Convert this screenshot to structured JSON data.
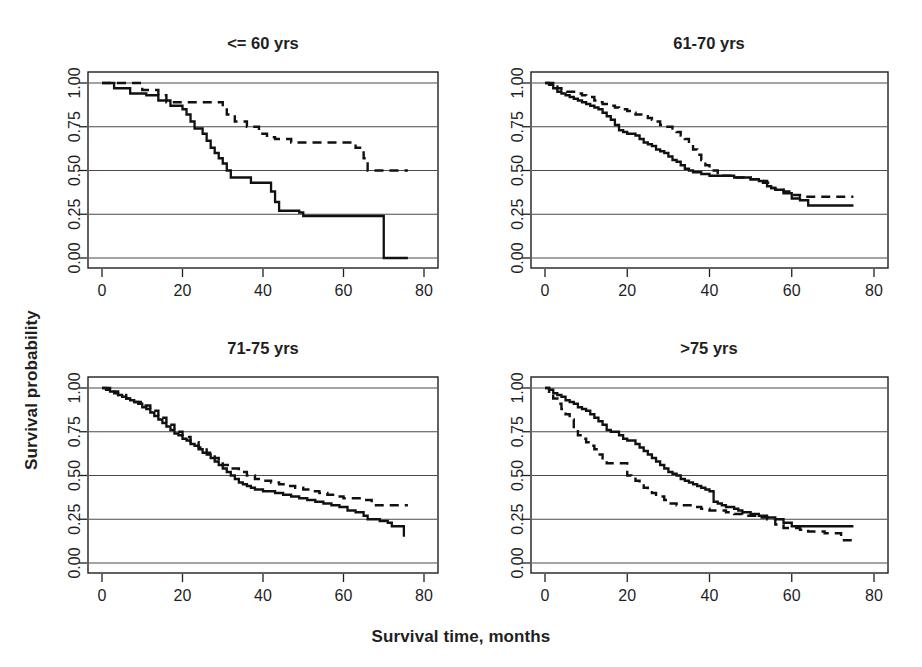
{
  "figure": {
    "x_axis_label": "Survival time, months",
    "y_axis_label": "Survival probability"
  },
  "chart_data": {
    "type": "line",
    "title": "",
    "xlabel": "Survival time, months",
    "ylabel": "Survival probability",
    "xlim": [
      0,
      80
    ],
    "ylim": [
      0,
      1.0
    ],
    "xticks": [
      0,
      20,
      40,
      60,
      80
    ],
    "xtick_labels": [
      "0",
      "20",
      "40",
      "60",
      "80"
    ],
    "yticks": [
      0.0,
      0.25,
      0.5,
      0.75,
      1.0
    ],
    "ytick_labels": [
      "0.00",
      "0.25",
      "0.50",
      "0.75",
      "1.00"
    ],
    "grid": "horizontal",
    "legend_position": "none",
    "series_styles": [
      {
        "name": "solid-group",
        "dash": "solid",
        "color": "#111111"
      },
      {
        "name": "dashed-group",
        "dash": "dashed",
        "color": "#111111"
      }
    ],
    "panels": [
      {
        "id": "panel-le-60",
        "title": "<= 60 yrs",
        "series": [
          {
            "name": "solid-group",
            "dash": "solid",
            "x": [
              0,
              2,
              3,
              5,
              7,
              9,
              11,
              13,
              14,
              16,
              17,
              19,
              20,
              21,
              22,
              23,
              25,
              26,
              27,
              28,
              29,
              30,
              31,
              32,
              34,
              37,
              40,
              42,
              43,
              44,
              49,
              50,
              58,
              70,
              70,
              76
            ],
            "y": [
              1.0,
              1.0,
              0.97,
              0.97,
              0.94,
              0.94,
              0.93,
              0.93,
              0.9,
              0.9,
              0.87,
              0.87,
              0.85,
              0.82,
              0.78,
              0.74,
              0.71,
              0.67,
              0.63,
              0.6,
              0.57,
              0.54,
              0.5,
              0.46,
              0.46,
              0.43,
              0.43,
              0.38,
              0.32,
              0.27,
              0.26,
              0.24,
              0.24,
              0.19,
              0.0,
              0.0
            ]
          },
          {
            "name": "dashed-group",
            "dash": "dashed",
            "x": [
              0,
              4,
              6,
              8,
              10,
              12,
              14,
              16,
              18,
              22,
              25,
              28,
              30,
              31,
              33,
              36,
              37,
              39,
              41,
              43,
              45,
              47,
              50,
              56,
              60,
              63,
              65,
              66,
              70,
              76
            ],
            "y": [
              1.0,
              1.0,
              1.0,
              1.0,
              0.96,
              0.96,
              0.93,
              0.89,
              0.89,
              0.89,
              0.89,
              0.89,
              0.86,
              0.82,
              0.78,
              0.75,
              0.75,
              0.71,
              0.69,
              0.68,
              0.68,
              0.66,
              0.66,
              0.66,
              0.66,
              0.63,
              0.57,
              0.5,
              0.5,
              0.5
            ]
          }
        ]
      },
      {
        "id": "panel-61-70",
        "title": "61-70 yrs",
        "series": [
          {
            "name": "solid-group",
            "dash": "solid",
            "x": [
              0,
              1,
              2,
              3,
              4,
              5,
              6,
              7,
              8,
              9,
              10,
              11,
              12,
              13,
              14,
              15,
              16,
              17,
              18,
              19,
              20,
              21,
              22,
              23,
              24,
              25,
              26,
              27,
              28,
              29,
              30,
              31,
              32,
              33,
              34,
              35,
              36,
              38,
              40,
              42,
              44,
              46,
              48,
              50,
              51,
              52,
              53,
              54,
              55,
              56,
              58,
              60,
              62,
              64,
              66,
              70,
              75
            ],
            "y": [
              1.0,
              0.99,
              0.97,
              0.95,
              0.94,
              0.93,
              0.92,
              0.91,
              0.9,
              0.89,
              0.88,
              0.87,
              0.86,
              0.85,
              0.83,
              0.81,
              0.79,
              0.76,
              0.73,
              0.72,
              0.71,
              0.71,
              0.7,
              0.68,
              0.66,
              0.65,
              0.64,
              0.62,
              0.61,
              0.6,
              0.58,
              0.56,
              0.55,
              0.53,
              0.51,
              0.5,
              0.49,
              0.48,
              0.47,
              0.47,
              0.47,
              0.46,
              0.46,
              0.45,
              0.45,
              0.44,
              0.43,
              0.41,
              0.4,
              0.39,
              0.37,
              0.34,
              0.33,
              0.3,
              0.3,
              0.3,
              0.3
            ]
          },
          {
            "name": "dashed-group",
            "dash": "dashed",
            "x": [
              0,
              2,
              3,
              4,
              5,
              6,
              8,
              9,
              10,
              12,
              13,
              14,
              16,
              17,
              18,
              19,
              20,
              21,
              22,
              24,
              25,
              26,
              27,
              28,
              29,
              30,
              31,
              32,
              33,
              34,
              35,
              36,
              37,
              38,
              39,
              40,
              42,
              44,
              46,
              48,
              50,
              52,
              53,
              54,
              55,
              56,
              58,
              60,
              62,
              64,
              68,
              75
            ],
            "y": [
              1.0,
              0.98,
              0.97,
              0.96,
              0.95,
              0.95,
              0.94,
              0.93,
              0.92,
              0.9,
              0.89,
              0.88,
              0.87,
              0.86,
              0.85,
              0.85,
              0.84,
              0.83,
              0.82,
              0.81,
              0.8,
              0.79,
              0.78,
              0.76,
              0.75,
              0.75,
              0.74,
              0.72,
              0.7,
              0.68,
              0.65,
              0.62,
              0.59,
              0.56,
              0.53,
              0.5,
              0.47,
              0.47,
              0.46,
              0.46,
              0.45,
              0.45,
              0.44,
              0.43,
              0.4,
              0.39,
              0.38,
              0.36,
              0.35,
              0.35,
              0.35,
              0.35
            ]
          }
        ]
      },
      {
        "id": "panel-71-75",
        "title": "71-75 yrs",
        "series": [
          {
            "name": "solid-group",
            "dash": "solid",
            "x": [
              0,
              1,
              2,
              3,
              4,
              5,
              6,
              7,
              8,
              9,
              10,
              11,
              12,
              13,
              14,
              15,
              16,
              17,
              18,
              19,
              20,
              21,
              22,
              23,
              24,
              25,
              26,
              27,
              28,
              29,
              30,
              31,
              32,
              33,
              34,
              35,
              36,
              37,
              38,
              39,
              40,
              41,
              43,
              45,
              47,
              49,
              51,
              53,
              55,
              57,
              59,
              61,
              63,
              65,
              66,
              67,
              69,
              71,
              72,
              74,
              75
            ],
            "y": [
              1.0,
              0.99,
              0.98,
              0.97,
              0.96,
              0.95,
              0.94,
              0.93,
              0.92,
              0.91,
              0.89,
              0.88,
              0.86,
              0.84,
              0.82,
              0.8,
              0.78,
              0.76,
              0.74,
              0.73,
              0.71,
              0.7,
              0.68,
              0.67,
              0.65,
              0.63,
              0.62,
              0.6,
              0.58,
              0.56,
              0.54,
              0.52,
              0.5,
              0.48,
              0.46,
              0.45,
              0.44,
              0.43,
              0.42,
              0.42,
              0.41,
              0.41,
              0.4,
              0.39,
              0.38,
              0.37,
              0.36,
              0.35,
              0.34,
              0.33,
              0.32,
              0.3,
              0.29,
              0.27,
              0.25,
              0.25,
              0.24,
              0.23,
              0.21,
              0.21,
              0.15
            ]
          },
          {
            "name": "dashed-group",
            "dash": "dashed",
            "x": [
              0,
              2,
              4,
              6,
              8,
              10,
              12,
              14,
              16,
              18,
              20,
              22,
              24,
              26,
              28,
              29,
              30,
              32,
              34,
              36,
              38,
              40,
              42,
              44,
              46,
              48,
              50,
              52,
              54,
              56,
              58,
              60,
              62,
              64,
              65,
              66,
              67,
              68,
              70,
              74,
              76
            ],
            "y": [
              1.0,
              0.98,
              0.96,
              0.94,
              0.92,
              0.9,
              0.87,
              0.83,
              0.79,
              0.75,
              0.72,
              0.69,
              0.66,
              0.63,
              0.6,
              0.58,
              0.56,
              0.54,
              0.52,
              0.5,
              0.48,
              0.47,
              0.46,
              0.45,
              0.44,
              0.43,
              0.42,
              0.41,
              0.4,
              0.39,
              0.38,
              0.37,
              0.37,
              0.36,
              0.36,
              0.36,
              0.33,
              0.33,
              0.33,
              0.33,
              0.33
            ]
          }
        ]
      },
      {
        "id": "panel-gt-75",
        "title": ">75 yrs",
        "series": [
          {
            "name": "solid-group",
            "dash": "solid",
            "x": [
              0,
              1,
              2,
              3,
              4,
              5,
              6,
              7,
              8,
              9,
              10,
              11,
              12,
              13,
              14,
              15,
              16,
              17,
              18,
              19,
              20,
              21,
              22,
              23,
              24,
              25,
              26,
              27,
              28,
              29,
              30,
              31,
              32,
              33,
              34,
              35,
              36,
              37,
              38,
              39,
              40,
              41,
              42,
              43,
              44,
              45,
              46,
              47,
              48,
              50,
              52,
              54,
              56,
              58,
              60,
              62,
              65,
              68,
              72,
              75
            ],
            "y": [
              1.0,
              0.99,
              0.97,
              0.96,
              0.95,
              0.93,
              0.92,
              0.91,
              0.89,
              0.88,
              0.87,
              0.85,
              0.83,
              0.81,
              0.79,
              0.76,
              0.75,
              0.75,
              0.73,
              0.71,
              0.7,
              0.7,
              0.68,
              0.66,
              0.64,
              0.62,
              0.6,
              0.58,
              0.56,
              0.54,
              0.52,
              0.51,
              0.5,
              0.48,
              0.47,
              0.46,
              0.45,
              0.44,
              0.43,
              0.42,
              0.41,
              0.35,
              0.34,
              0.33,
              0.32,
              0.32,
              0.31,
              0.3,
              0.29,
              0.28,
              0.27,
              0.26,
              0.25,
              0.23,
              0.21,
              0.21,
              0.21,
              0.21,
              0.21,
              0.21
            ]
          },
          {
            "name": "dashed-group",
            "dash": "dashed",
            "x": [
              0,
              1,
              2,
              3,
              4,
              5,
              6,
              7,
              8,
              9,
              10,
              11,
              12,
              13,
              14,
              15,
              16,
              17,
              18,
              19,
              20,
              21,
              22,
              23,
              24,
              25,
              26,
              27,
              28,
              29,
              30,
              32,
              34,
              36,
              38,
              40,
              42,
              44,
              46,
              48,
              50,
              52,
              54,
              56,
              58,
              60,
              62,
              64,
              66,
              68,
              70,
              72,
              75
            ],
            "y": [
              1.0,
              0.97,
              0.94,
              0.91,
              0.88,
              0.85,
              0.82,
              0.76,
              0.73,
              0.71,
              0.69,
              0.67,
              0.65,
              0.62,
              0.59,
              0.57,
              0.57,
              0.57,
              0.57,
              0.57,
              0.5,
              0.49,
              0.47,
              0.45,
              0.43,
              0.42,
              0.4,
              0.39,
              0.38,
              0.36,
              0.34,
              0.33,
              0.33,
              0.32,
              0.31,
              0.3,
              0.3,
              0.29,
              0.28,
              0.27,
              0.27,
              0.26,
              0.25,
              0.22,
              0.2,
              0.2,
              0.19,
              0.18,
              0.18,
              0.17,
              0.17,
              0.13,
              0.13
            ]
          }
        ]
      }
    ]
  }
}
